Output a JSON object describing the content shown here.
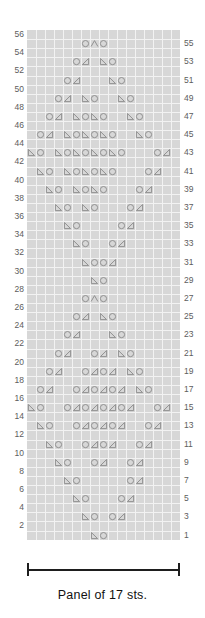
{
  "chart": {
    "stitch_count": 17,
    "row_count": 56,
    "caption": "Panel of 17 sts.",
    "colors": {
      "grid_background": "#d7d7d7",
      "grid_lines": "#f2f2f2",
      "symbol": "#8d8d8d",
      "row_number": "#5d5d5d",
      "bracket": "#1e1e1e"
    },
    "legend": {
      "yo": "yarn-over",
      "k2tog": "knit-two-together-right-decrease",
      "ssk": "slip-slip-knit-left-decrease",
      "cdd": "centered-double-decrease"
    },
    "left_row_numbers": [
      56,
      54,
      52,
      50,
      48,
      46,
      44,
      42,
      40,
      38,
      36,
      34,
      32,
      30,
      28,
      26,
      24,
      22,
      20,
      18,
      16,
      14,
      12,
      10,
      8,
      6,
      4,
      2
    ],
    "right_row_numbers": [
      55,
      53,
      51,
      49,
      47,
      45,
      43,
      41,
      39,
      37,
      35,
      33,
      31,
      29,
      27,
      25,
      23,
      21,
      19,
      17,
      15,
      13,
      11,
      9,
      7,
      5,
      3,
      1
    ],
    "rows": [
      {
        "row": 56,
        "cells": []
      },
      {
        "row": 55,
        "cells": [
          {
            "c": 7,
            "s": "yo"
          },
          {
            "c": 8,
            "s": "cdd"
          },
          {
            "c": 9,
            "s": "yo"
          }
        ]
      },
      {
        "row": 54,
        "cells": []
      },
      {
        "row": 53,
        "cells": [
          {
            "c": 6,
            "s": "yo"
          },
          {
            "c": 7,
            "s": "k2tog"
          },
          {
            "c": 9,
            "s": "ssk"
          },
          {
            "c": 10,
            "s": "yo"
          }
        ]
      },
      {
        "row": 52,
        "cells": []
      },
      {
        "row": 51,
        "cells": [
          {
            "c": 5,
            "s": "yo"
          },
          {
            "c": 6,
            "s": "k2tog"
          },
          {
            "c": 10,
            "s": "ssk"
          },
          {
            "c": 11,
            "s": "yo"
          }
        ]
      },
      {
        "row": 50,
        "cells": []
      },
      {
        "row": 49,
        "cells": [
          {
            "c": 4,
            "s": "yo"
          },
          {
            "c": 5,
            "s": "k2tog"
          },
          {
            "c": 7,
            "s": "ssk"
          },
          {
            "c": 8,
            "s": "yo"
          },
          {
            "c": 11,
            "s": "ssk"
          },
          {
            "c": 12,
            "s": "yo"
          }
        ]
      },
      {
        "row": 48,
        "cells": []
      },
      {
        "row": 47,
        "cells": [
          {
            "c": 3,
            "s": "yo"
          },
          {
            "c": 4,
            "s": "k2tog"
          },
          {
            "c": 6,
            "s": "ssk"
          },
          {
            "c": 7,
            "s": "yo"
          },
          {
            "c": 8,
            "s": "ssk"
          },
          {
            "c": 9,
            "s": "yo"
          },
          {
            "c": 12,
            "s": "ssk"
          },
          {
            "c": 13,
            "s": "yo"
          }
        ]
      },
      {
        "row": 46,
        "cells": []
      },
      {
        "row": 45,
        "cells": [
          {
            "c": 2,
            "s": "yo"
          },
          {
            "c": 3,
            "s": "k2tog"
          },
          {
            "c": 5,
            "s": "ssk"
          },
          {
            "c": 6,
            "s": "yo"
          },
          {
            "c": 7,
            "s": "ssk"
          },
          {
            "c": 8,
            "s": "yo"
          },
          {
            "c": 9,
            "s": "ssk"
          },
          {
            "c": 10,
            "s": "yo"
          },
          {
            "c": 13,
            "s": "ssk"
          },
          {
            "c": 14,
            "s": "yo"
          }
        ]
      },
      {
        "row": 44,
        "cells": []
      },
      {
        "row": 43,
        "cells": [
          {
            "c": 1,
            "s": "ssk"
          },
          {
            "c": 2,
            "s": "yo"
          },
          {
            "c": 4,
            "s": "ssk"
          },
          {
            "c": 5,
            "s": "yo"
          },
          {
            "c": 6,
            "s": "ssk"
          },
          {
            "c": 7,
            "s": "yo"
          },
          {
            "c": 8,
            "s": "ssk"
          },
          {
            "c": 9,
            "s": "yo"
          },
          {
            "c": 10,
            "s": "ssk"
          },
          {
            "c": 11,
            "s": "yo"
          },
          {
            "c": 15,
            "s": "yo"
          },
          {
            "c": 16,
            "s": "k2tog"
          }
        ]
      },
      {
        "row": 42,
        "cells": []
      },
      {
        "row": 41,
        "cells": [
          {
            "c": 2,
            "s": "ssk"
          },
          {
            "c": 3,
            "s": "yo"
          },
          {
            "c": 5,
            "s": "ssk"
          },
          {
            "c": 6,
            "s": "yo"
          },
          {
            "c": 7,
            "s": "ssk"
          },
          {
            "c": 8,
            "s": "yo"
          },
          {
            "c": 9,
            "s": "ssk"
          },
          {
            "c": 10,
            "s": "yo"
          },
          {
            "c": 14,
            "s": "yo"
          },
          {
            "c": 15,
            "s": "k2tog"
          }
        ]
      },
      {
        "row": 40,
        "cells": []
      },
      {
        "row": 39,
        "cells": [
          {
            "c": 3,
            "s": "ssk"
          },
          {
            "c": 4,
            "s": "yo"
          },
          {
            "c": 6,
            "s": "ssk"
          },
          {
            "c": 7,
            "s": "yo"
          },
          {
            "c": 8,
            "s": "ssk"
          },
          {
            "c": 9,
            "s": "yo"
          },
          {
            "c": 13,
            "s": "yo"
          },
          {
            "c": 14,
            "s": "k2tog"
          }
        ]
      },
      {
        "row": 38,
        "cells": []
      },
      {
        "row": 37,
        "cells": [
          {
            "c": 4,
            "s": "ssk"
          },
          {
            "c": 5,
            "s": "yo"
          },
          {
            "c": 7,
            "s": "ssk"
          },
          {
            "c": 8,
            "s": "yo"
          },
          {
            "c": 12,
            "s": "yo"
          },
          {
            "c": 13,
            "s": "k2tog"
          }
        ]
      },
      {
        "row": 36,
        "cells": []
      },
      {
        "row": 35,
        "cells": [
          {
            "c": 5,
            "s": "ssk"
          },
          {
            "c": 6,
            "s": "yo"
          },
          {
            "c": 11,
            "s": "yo"
          },
          {
            "c": 12,
            "s": "k2tog"
          }
        ]
      },
      {
        "row": 34,
        "cells": []
      },
      {
        "row": 33,
        "cells": [
          {
            "c": 6,
            "s": "ssk"
          },
          {
            "c": 7,
            "s": "yo"
          },
          {
            "c": 10,
            "s": "yo"
          },
          {
            "c": 11,
            "s": "k2tog"
          }
        ]
      },
      {
        "row": 32,
        "cells": []
      },
      {
        "row": 31,
        "cells": [
          {
            "c": 7,
            "s": "ssk"
          },
          {
            "c": 8,
            "s": "yo"
          },
          {
            "c": 9,
            "s": "yo"
          },
          {
            "c": 10,
            "s": "k2tog"
          }
        ]
      },
      {
        "row": 30,
        "cells": []
      },
      {
        "row": 29,
        "cells": [
          {
            "c": 8,
            "s": "ssk"
          },
          {
            "c": 9,
            "s": "yo"
          }
        ]
      },
      {
        "row": 28,
        "cells": []
      },
      {
        "row": 27,
        "cells": [
          {
            "c": 7,
            "s": "yo"
          },
          {
            "c": 8,
            "s": "cdd"
          },
          {
            "c": 9,
            "s": "yo"
          }
        ]
      },
      {
        "row": 26,
        "cells": []
      },
      {
        "row": 25,
        "cells": [
          {
            "c": 6,
            "s": "yo"
          },
          {
            "c": 7,
            "s": "k2tog"
          },
          {
            "c": 9,
            "s": "ssk"
          },
          {
            "c": 10,
            "s": "yo"
          }
        ]
      },
      {
        "row": 24,
        "cells": []
      },
      {
        "row": 23,
        "cells": [
          {
            "c": 5,
            "s": "yo"
          },
          {
            "c": 6,
            "s": "k2tog"
          },
          {
            "c": 10,
            "s": "ssk"
          },
          {
            "c": 11,
            "s": "yo"
          }
        ]
      },
      {
        "row": 22,
        "cells": []
      },
      {
        "row": 21,
        "cells": [
          {
            "c": 4,
            "s": "yo"
          },
          {
            "c": 5,
            "s": "k2tog"
          },
          {
            "c": 8,
            "s": "yo"
          },
          {
            "c": 9,
            "s": "k2tog"
          },
          {
            "c": 11,
            "s": "ssk"
          },
          {
            "c": 12,
            "s": "yo"
          }
        ]
      },
      {
        "row": 20,
        "cells": []
      },
      {
        "row": 19,
        "cells": [
          {
            "c": 3,
            "s": "yo"
          },
          {
            "c": 4,
            "s": "k2tog"
          },
          {
            "c": 7,
            "s": "yo"
          },
          {
            "c": 8,
            "s": "k2tog"
          },
          {
            "c": 9,
            "s": "yo"
          },
          {
            "c": 10,
            "s": "k2tog"
          },
          {
            "c": 12,
            "s": "ssk"
          },
          {
            "c": 13,
            "s": "yo"
          }
        ]
      },
      {
        "row": 18,
        "cells": []
      },
      {
        "row": 17,
        "cells": [
          {
            "c": 2,
            "s": "yo"
          },
          {
            "c": 3,
            "s": "k2tog"
          },
          {
            "c": 6,
            "s": "yo"
          },
          {
            "c": 7,
            "s": "k2tog"
          },
          {
            "c": 8,
            "s": "yo"
          },
          {
            "c": 9,
            "s": "k2tog"
          },
          {
            "c": 10,
            "s": "yo"
          },
          {
            "c": 11,
            "s": "k2tog"
          },
          {
            "c": 13,
            "s": "ssk"
          },
          {
            "c": 14,
            "s": "yo"
          }
        ]
      },
      {
        "row": 16,
        "cells": []
      },
      {
        "row": 15,
        "cells": [
          {
            "c": 1,
            "s": "ssk"
          },
          {
            "c": 2,
            "s": "yo"
          },
          {
            "c": 5,
            "s": "yo"
          },
          {
            "c": 6,
            "s": "k2tog"
          },
          {
            "c": 7,
            "s": "yo"
          },
          {
            "c": 8,
            "s": "k2tog"
          },
          {
            "c": 9,
            "s": "yo"
          },
          {
            "c": 10,
            "s": "k2tog"
          },
          {
            "c": 11,
            "s": "yo"
          },
          {
            "c": 12,
            "s": "k2tog"
          },
          {
            "c": 15,
            "s": "yo"
          },
          {
            "c": 16,
            "s": "k2tog"
          }
        ]
      },
      {
        "row": 14,
        "cells": []
      },
      {
        "row": 13,
        "cells": [
          {
            "c": 2,
            "s": "ssk"
          },
          {
            "c": 3,
            "s": "yo"
          },
          {
            "c": 6,
            "s": "yo"
          },
          {
            "c": 7,
            "s": "k2tog"
          },
          {
            "c": 8,
            "s": "yo"
          },
          {
            "c": 9,
            "s": "k2tog"
          },
          {
            "c": 10,
            "s": "yo"
          },
          {
            "c": 11,
            "s": "k2tog"
          },
          {
            "c": 14,
            "s": "yo"
          },
          {
            "c": 15,
            "s": "k2tog"
          }
        ]
      },
      {
        "row": 12,
        "cells": []
      },
      {
        "row": 11,
        "cells": [
          {
            "c": 3,
            "s": "ssk"
          },
          {
            "c": 4,
            "s": "yo"
          },
          {
            "c": 7,
            "s": "yo"
          },
          {
            "c": 8,
            "s": "k2tog"
          },
          {
            "c": 9,
            "s": "yo"
          },
          {
            "c": 10,
            "s": "k2tog"
          },
          {
            "c": 13,
            "s": "yo"
          },
          {
            "c": 14,
            "s": "k2tog"
          }
        ]
      },
      {
        "row": 10,
        "cells": []
      },
      {
        "row": 9,
        "cells": [
          {
            "c": 4,
            "s": "ssk"
          },
          {
            "c": 5,
            "s": "yo"
          },
          {
            "c": 8,
            "s": "yo"
          },
          {
            "c": 9,
            "s": "k2tog"
          },
          {
            "c": 12,
            "s": "yo"
          },
          {
            "c": 13,
            "s": "k2tog"
          }
        ]
      },
      {
        "row": 8,
        "cells": []
      },
      {
        "row": 7,
        "cells": [
          {
            "c": 5,
            "s": "ssk"
          },
          {
            "c": 6,
            "s": "yo"
          },
          {
            "c": 12,
            "s": "yo"
          },
          {
            "c": 13,
            "s": "k2tog"
          }
        ]
      },
      {
        "row": 6,
        "cells": []
      },
      {
        "row": 5,
        "cells": [
          {
            "c": 6,
            "s": "ssk"
          },
          {
            "c": 7,
            "s": "yo"
          },
          {
            "c": 11,
            "s": "yo"
          },
          {
            "c": 12,
            "s": "k2tog"
          }
        ]
      },
      {
        "row": 4,
        "cells": []
      },
      {
        "row": 3,
        "cells": [
          {
            "c": 7,
            "s": "ssk"
          },
          {
            "c": 8,
            "s": "yo"
          },
          {
            "c": 10,
            "s": "yo"
          },
          {
            "c": 11,
            "s": "k2tog"
          }
        ]
      },
      {
        "row": 2,
        "cells": []
      },
      {
        "row": 1,
        "cells": [
          {
            "c": 8,
            "s": "ssk"
          },
          {
            "c": 9,
            "s": "yo"
          }
        ]
      }
    ]
  }
}
